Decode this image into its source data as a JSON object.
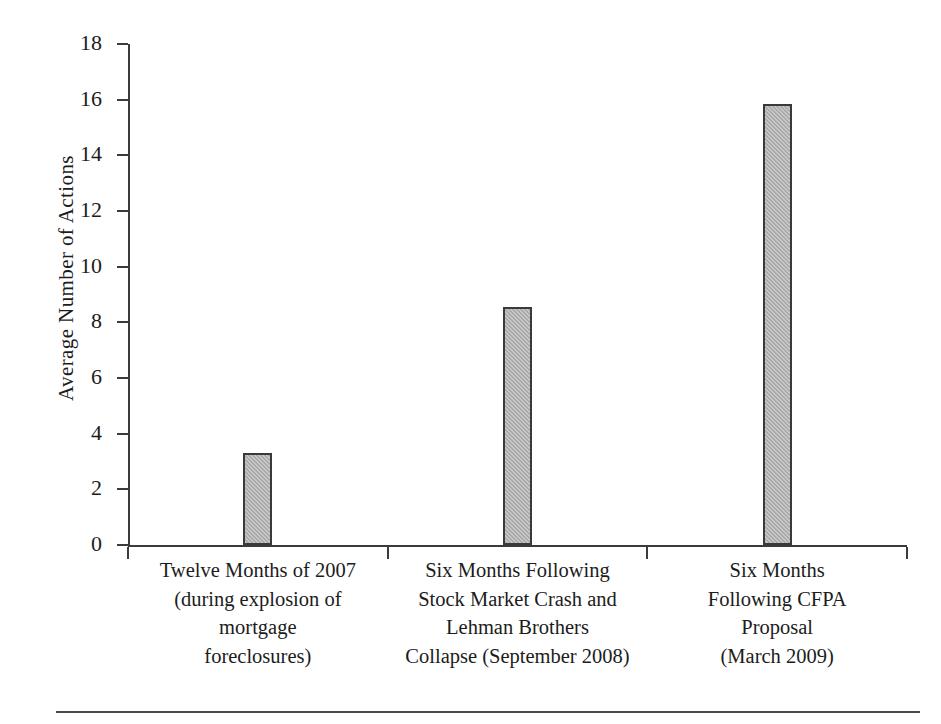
{
  "chart_data": {
    "type": "bar",
    "title": "",
    "xlabel": "",
    "ylabel": "Average Number of Actions",
    "ylim": [
      0,
      18
    ],
    "ytick_step": 2,
    "grid": false,
    "legend": "none",
    "categories": [
      "Twelve Months of 2007 (during explosion of mortgage foreclosures)",
      "Six Months Following Stock Market Crash and Lehman Brothers Collapse (September 2008)",
      "Six Months Following CFPA Proposal (March 2009)"
    ],
    "category_lines": [
      [
        "Twelve Months of 2007",
        "(during explosion of",
        "mortgage",
        "foreclosures)"
      ],
      [
        "Six Months Following",
        "Stock Market Crash and",
        "Lehman Brothers",
        "Collapse (September 2008)"
      ],
      [
        "Six Months",
        "Following CFPA",
        "Proposal",
        "(March 2009)"
      ]
    ],
    "values": [
      3.3,
      8.55,
      15.85
    ],
    "ytick_labels": [
      "18",
      "16",
      "14",
      "12",
      "10",
      "8",
      "6",
      "4",
      "2",
      "0"
    ],
    "ytick_values": [
      18,
      16,
      14,
      12,
      10,
      8,
      6,
      4,
      2,
      0
    ],
    "colors": {
      "bar_fill": "#a9a9a9",
      "bar_border": "#3a3a3a",
      "axis": "#3b3b3b",
      "text": "#1c1c1c",
      "background": "#ffffff"
    }
  }
}
